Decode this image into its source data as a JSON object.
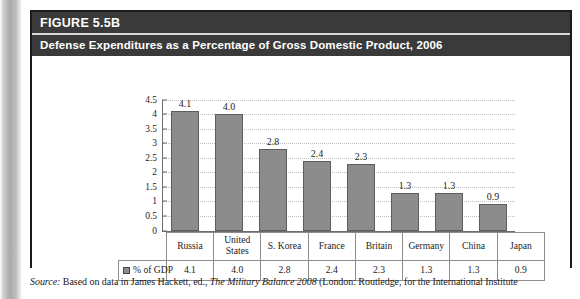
{
  "figure": {
    "number_label": "FIGURE 5.5B",
    "title": "Defense Expenditures as a Percentage of Gross Domestic Product, 2006"
  },
  "legend": {
    "series_label": "% of GDP",
    "swatch_name": "legend-swatch"
  },
  "source": {
    "prefix": "Source:",
    "body_1": " Based on data in James Hackett, ed., ",
    "work_italic": "The Military Balance 2008",
    "body_2": " (London: Routledge, for the International Institute"
  },
  "colors": {
    "bar_fill": "#8c8c8c",
    "bar_stroke": "#5d5d5d",
    "band_bg": "#3a3a3a",
    "band_text": "#ffffff",
    "gridline": "#c0c0c0",
    "axis": "#6d6d6d",
    "table_border": "#8d8d8d"
  },
  "chart_data": {
    "type": "bar",
    "title": "Defense Expenditures as a Percentage of Gross Domestic Product, 2006",
    "xlabel": "",
    "ylabel": "",
    "ylim": [
      0,
      4.5
    ],
    "ytick_step": 0.5,
    "yticks": [
      "4.5",
      "4",
      "3.5",
      "3",
      "2.5",
      "2",
      "1.5",
      "1",
      "0.5",
      "0"
    ],
    "grid": true,
    "legend_position": "table-row",
    "categories": [
      "Russia",
      "United States",
      "S. Korea",
      "France",
      "Britain",
      "Germany",
      "China",
      "Japan"
    ],
    "series": [
      {
        "name": "% of GDP",
        "values": [
          4.1,
          4.0,
          2.8,
          2.4,
          2.3,
          1.3,
          1.3,
          0.9
        ],
        "value_labels": [
          "4.1",
          "4.0",
          "2.8",
          "2.4",
          "2.3",
          "1.3",
          "1.3",
          "0.9"
        ]
      }
    ]
  }
}
